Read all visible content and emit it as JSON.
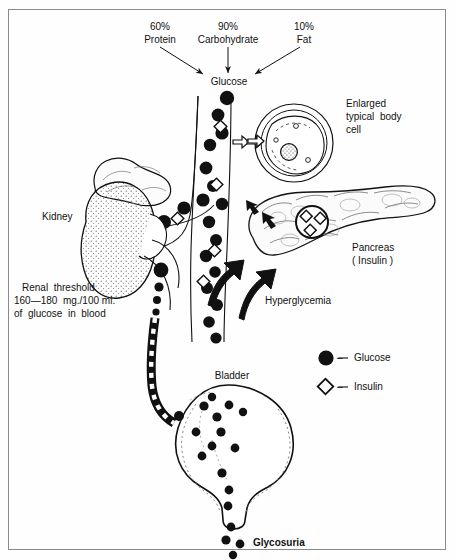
{
  "diagram": {
    "title_context": "Glucose metabolism, hyperglycemia and glycosuria",
    "nutrient_sources": [
      {
        "percent": "60%",
        "name": "Protein"
      },
      {
        "percent": "90%",
        "name": "Carbohydrate"
      },
      {
        "percent": "10%",
        "name": "Fat"
      }
    ],
    "glucose_node": "Glucose",
    "cell_label": "Enlarged\ntypical body\ncell",
    "cell_label_lines": [
      "Enlarged",
      "typical  body",
      "cell"
    ],
    "pancreas_label_lines": [
      "Pancreas",
      "( Insulin )"
    ],
    "kidney_label": "Kidney",
    "renal_threshold_lines": [
      "Renal  threshold",
      "160—180  mg./100 ml.",
      "of  glucose  in  blood"
    ],
    "hyperglycemia_label": "Hyperglycemia",
    "bladder_label": "Bladder",
    "glycosuria_label": "Glycosuria",
    "legend": [
      {
        "symbol": "filled-circle",
        "dash": "–",
        "label": "Glucose"
      },
      {
        "symbol": "open-diamond",
        "dash": "–",
        "label": "Insulin"
      }
    ],
    "colors": {
      "ink": "#000000",
      "paper": "#fefefe",
      "frame": "#8a8a8a",
      "stipple": "#555555"
    }
  }
}
